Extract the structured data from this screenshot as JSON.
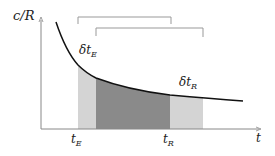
{
  "diagram": {
    "y_axis_label": "c/R",
    "x_axis_label": "t",
    "annotations": {
      "delta_t_E": {
        "base": "δt",
        "sub": "E"
      },
      "delta_t_R": {
        "base": "δt",
        "sub": "R"
      }
    },
    "ticks": {
      "t_E": {
        "base": "t",
        "sub": "E"
      },
      "t_R": {
        "base": "t",
        "sub": "R"
      }
    },
    "colors": {
      "light_region": "#d4d4d4",
      "dark_region": "#8a8a8a",
      "curve": "#111111",
      "axes": "#888888",
      "brackets": "#999999"
    }
  }
}
